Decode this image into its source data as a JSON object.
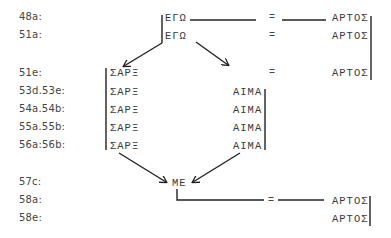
{
  "rows": [
    {
      "ref": "48a:",
      "y": 11
    },
    {
      "ref": "51a:",
      "y": 30
    },
    {
      "ref": "51e:",
      "y": 67
    },
    {
      "ref": "53d.53e:",
      "y": 86
    },
    {
      "ref": "54a.54b:",
      "y": 104
    },
    {
      "ref": "55a.55b:",
      "y": 122
    },
    {
      "ref": "56a:56b:",
      "y": 140
    },
    {
      "ref": "57c:",
      "y": 177
    },
    {
      "ref": "58a:",
      "y": 195
    },
    {
      "ref": "58e:",
      "y": 213
    }
  ],
  "terms": {
    "ego": "ΕΓΩ",
    "sarx": "ΣΑΡΞ",
    "haima": "ΑΙΜΑ",
    "artos": "ΑΡΤΟΣ",
    "me": "ΜΕ",
    "equals": "="
  }
}
